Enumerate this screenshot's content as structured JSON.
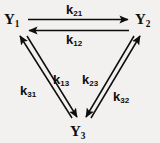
{
  "diagram": {
    "type": "three-state-kinetic-scheme",
    "background_color": "#f2f1ef",
    "ink_color": "#0d0d0d",
    "nodes": [
      {
        "id": "Y1",
        "base": "Y",
        "sub": "1",
        "position": "top-left"
      },
      {
        "id": "Y2",
        "base": "Y",
        "sub": "2",
        "position": "top-right"
      },
      {
        "id": "Y3",
        "base": "Y",
        "sub": "3",
        "position": "bottom-center"
      }
    ],
    "edges": [
      {
        "id": "k21",
        "base": "k",
        "sub": "21",
        "from": "Y1",
        "to": "Y2",
        "side": "top-upper",
        "direction": "rightward"
      },
      {
        "id": "k12",
        "base": "k",
        "sub": "12",
        "from": "Y2",
        "to": "Y1",
        "side": "top-lower",
        "direction": "leftward"
      },
      {
        "id": "k31",
        "base": "k",
        "sub": "31",
        "from": "Y3",
        "to": "Y1",
        "side": "left-outer",
        "direction": "up-left"
      },
      {
        "id": "k13",
        "base": "k",
        "sub": "13",
        "from": "Y1",
        "to": "Y3",
        "side": "left-inner",
        "direction": "down-right"
      },
      {
        "id": "k23",
        "base": "k",
        "sub": "23",
        "from": "Y2",
        "to": "Y3",
        "side": "right-inner",
        "direction": "down-left"
      },
      {
        "id": "k32",
        "base": "k",
        "sub": "32",
        "from": "Y3",
        "to": "Y2",
        "side": "right-outer",
        "direction": "up-right"
      }
    ]
  }
}
